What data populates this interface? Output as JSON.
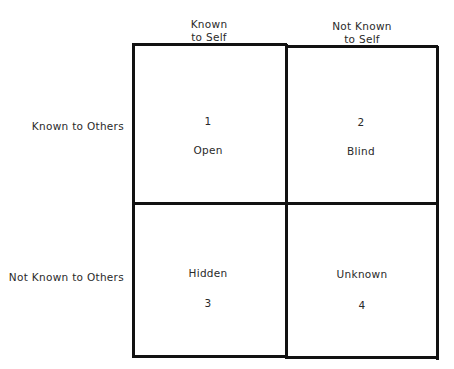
{
  "diagram": {
    "column_headers": [
      {
        "line1": "Known",
        "line2": "to Self"
      },
      {
        "line1": "Not Known",
        "line2": "to Self"
      }
    ],
    "row_headers": [
      "Known to Others",
      "Not Known to Others"
    ],
    "cells": [
      {
        "number": "1",
        "label": "Open"
      },
      {
        "number": "2",
        "label": "Blind"
      },
      {
        "number": "3",
        "label": "Hidden"
      },
      {
        "number": "4",
        "label": "Unknown"
      }
    ]
  }
}
